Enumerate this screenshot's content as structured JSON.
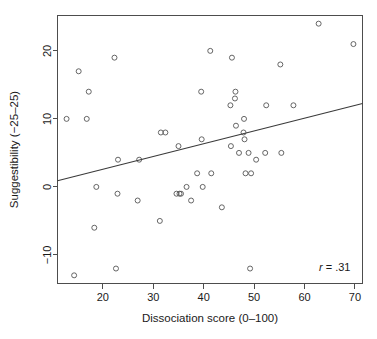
{
  "figure": {
    "name": "suggestibility-vs-dissociation-scatter",
    "background_color": "#ffffff",
    "point_color": "#555555",
    "line_color": "#3a3a3a",
    "axis_color": "#4d4d4d"
  },
  "chart_data": {
    "type": "scatter",
    "title": "",
    "xlabel": "Dissociation score (0–100)",
    "ylabel": "Suggestibility (−25–25)",
    "xlim": [
      11.0,
      71.5
    ],
    "ylim": [
      -14.2,
      25.2
    ],
    "xticks": [
      20,
      30,
      40,
      50,
      60,
      70
    ],
    "xticklabels": [
      "20",
      "30",
      "40",
      "50",
      "60",
      "70"
    ],
    "yticks": [
      -10,
      0,
      10,
      20
    ],
    "yticklabels": [
      "−10",
      "0",
      "10",
      "20"
    ],
    "grid": false,
    "legend": null,
    "annotations": [
      {
        "name": "correlation-annotation",
        "symbol": "r",
        "equals": "= .31",
        "text": "r = .31",
        "x": 66.0,
        "y": -12.3
      }
    ],
    "fit_line": {
      "name": "regression-line",
      "type": "linear",
      "slope": 0.1875,
      "intercept": -1.16,
      "x_start": 11.0,
      "y_start": 0.9,
      "x_end": 71.5,
      "y_end": 12.25
    },
    "series": [
      {
        "name": "participants",
        "marker": "open-circle",
        "points": [
          [
            12.8,
            10.0
          ],
          [
            14.3,
            -13.0
          ],
          [
            15.2,
            17.0
          ],
          [
            16.8,
            10.0
          ],
          [
            17.2,
            14.0
          ],
          [
            18.3,
            -6.0
          ],
          [
            18.7,
            0.0
          ],
          [
            22.3,
            19.0
          ],
          [
            22.6,
            -12.0
          ],
          [
            22.9,
            -1.0
          ],
          [
            23.0,
            4.0
          ],
          [
            26.9,
            -2.0
          ],
          [
            27.2,
            4.0
          ],
          [
            31.3,
            -5.0
          ],
          [
            31.5,
            8.0
          ],
          [
            32.4,
            8.0
          ],
          [
            34.6,
            -1.0
          ],
          [
            35.0,
            6.0
          ],
          [
            35.2,
            -1.0
          ],
          [
            35.5,
            -1.0
          ],
          [
            36.6,
            0.0
          ],
          [
            37.5,
            -2.0
          ],
          [
            38.7,
            2.0
          ],
          [
            39.5,
            14.0
          ],
          [
            39.6,
            7.0
          ],
          [
            39.8,
            0.0
          ],
          [
            41.3,
            20.0
          ],
          [
            41.5,
            2.0
          ],
          [
            43.6,
            -3.0
          ],
          [
            45.3,
            12.0
          ],
          [
            45.4,
            6.0
          ],
          [
            45.6,
            19.0
          ],
          [
            46.2,
            13.0
          ],
          [
            46.3,
            14.0
          ],
          [
            46.4,
            9.0
          ],
          [
            47.0,
            5.0
          ],
          [
            47.9,
            8.0
          ],
          [
            48.0,
            10.0
          ],
          [
            48.1,
            7.0
          ],
          [
            48.3,
            2.0
          ],
          [
            48.9,
            5.0
          ],
          [
            49.2,
            -12.0
          ],
          [
            49.4,
            2.0
          ],
          [
            50.4,
            4.0
          ],
          [
            52.2,
            5.0
          ],
          [
            52.4,
            12.0
          ],
          [
            55.2,
            18.0
          ],
          [
            55.4,
            5.0
          ],
          [
            57.8,
            12.0
          ],
          [
            62.8,
            24.0
          ],
          [
            69.7,
            21.0
          ]
        ]
      }
    ]
  }
}
